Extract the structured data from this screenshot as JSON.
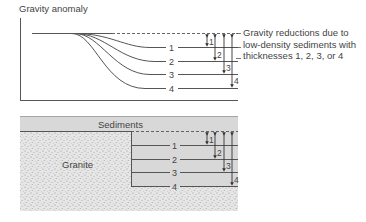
{
  "top_panel": {
    "title": "Gravity anomaly",
    "curve_labels": [
      "1",
      "2",
      "3",
      "4"
    ],
    "arrow_labels": [
      "1",
      "2",
      "3",
      "4"
    ],
    "note_lines": [
      "Gravity reductions due to",
      "low-density sediments with",
      "thicknesses 1, 2, 3, or 4"
    ]
  },
  "bottom_panel": {
    "sediments_label": "Sediments",
    "granite_label": "Granite",
    "layer_labels": [
      "1",
      "2",
      "3",
      "4"
    ],
    "arrow_labels": [
      "1",
      "2",
      "3",
      "4"
    ]
  },
  "colors": {
    "line": "#555555",
    "sediment_fill": "#d6d6d6",
    "granite_fill": "#e4e4e4",
    "granite_speckle": "#9a9a9a",
    "text": "#444444"
  }
}
